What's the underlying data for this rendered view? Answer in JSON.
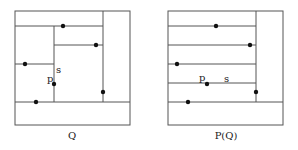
{
  "diagrams": [
    {
      "caption": "Q",
      "caption_pos": [
        72,
        139
      ],
      "box": [
        15,
        11,
        130,
        125
      ],
      "lines": [
        [
          103,
          11,
          103,
          102
        ],
        [
          15,
          26,
          103,
          26
        ],
        [
          54,
          26,
          54,
          102
        ],
        [
          54,
          45,
          103,
          45
        ],
        [
          15,
          64,
          54,
          64
        ],
        [
          15,
          102,
          130,
          102
        ]
      ],
      "points": [
        [
          63,
          26
        ],
        [
          96,
          45
        ],
        [
          25,
          64
        ],
        [
          54,
          84
        ],
        [
          103,
          92
        ],
        [
          36,
          102
        ]
      ],
      "labels": [
        {
          "text": "p",
          "x": 47,
          "y": 82
        },
        {
          "text": "s",
          "x": 56,
          "y": 73
        }
      ]
    },
    {
      "caption": "P(Q)",
      "caption_pos": [
        226,
        139
      ],
      "box": [
        168,
        11,
        283,
        125
      ],
      "lines": [
        [
          256,
          11,
          256,
          102
        ],
        [
          168,
          26,
          256,
          26
        ],
        [
          168,
          45,
          256,
          45
        ],
        [
          168,
          64,
          256,
          64
        ],
        [
          168,
          83,
          256,
          83
        ],
        [
          168,
          102,
          283,
          102
        ]
      ],
      "points": [
        [
          216,
          26
        ],
        [
          250,
          45
        ],
        [
          177,
          64
        ],
        [
          207,
          84
        ],
        [
          256,
          92
        ],
        [
          188,
          102
        ]
      ],
      "labels": [
        {
          "text": "p",
          "x": 199,
          "y": 81
        },
        {
          "text": "s",
          "x": 224,
          "y": 82
        }
      ]
    }
  ]
}
